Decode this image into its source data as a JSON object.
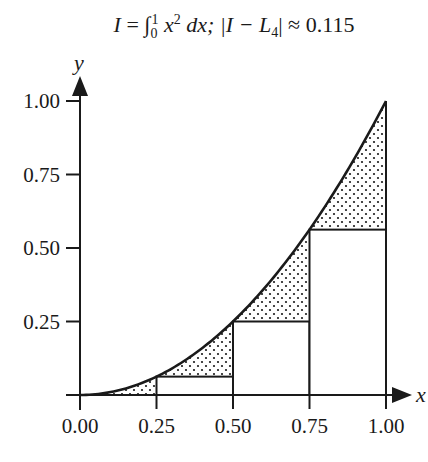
{
  "title": {
    "lhs": "I",
    "eq": " = ",
    "integral": "∫",
    "lower": "0",
    "upper": "1",
    "integrand": "x",
    "power": "2",
    "dx": " dx; ",
    "error_expr": "|I − L",
    "error_sub": "4",
    "error_tail": "| ≈ 0.115"
  },
  "axes": {
    "x_label": "x",
    "y_label": "y",
    "x_ticks": [
      "0.00",
      "0.25",
      "0.50",
      "0.75",
      "1.00"
    ],
    "y_ticks": [
      "0.25",
      "0.50",
      "0.75",
      "1.00"
    ]
  },
  "colors": {
    "ink": "#1a1a1a",
    "background": "#ffffff",
    "dot_fill": "#1a1a1a"
  },
  "chart_data": {
    "type": "area",
    "xlabel": "x",
    "ylabel": "y",
    "xlim": [
      0,
      1
    ],
    "ylim": [
      0,
      1
    ],
    "grid": false,
    "curve": {
      "name": "y = x^2",
      "x": [
        0,
        0.125,
        0.25,
        0.375,
        0.5,
        0.625,
        0.75,
        0.875,
        1.0
      ],
      "y": [
        0,
        0.015625,
        0.0625,
        0.140625,
        0.25,
        0.390625,
        0.5625,
        0.765625,
        1.0
      ]
    },
    "rectangles": {
      "name": "Left Riemann sum L4",
      "x_left": [
        0.0,
        0.25,
        0.5,
        0.75
      ],
      "width": 0.25,
      "heights": [
        0.0,
        0.0625,
        0.25,
        0.5625
      ]
    },
    "shaded_region": "Dotted area between curve y=x^2 and left-endpoint rectangles (error)",
    "error_value": 0.115,
    "x_ticks": [
      0.0,
      0.25,
      0.5,
      0.75,
      1.0
    ],
    "y_ticks": [
      0.25,
      0.5,
      0.75,
      1.0
    ]
  }
}
